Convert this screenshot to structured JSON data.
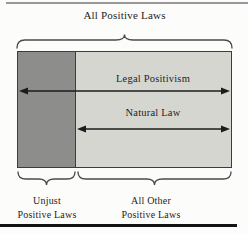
{
  "figure": {
    "title": "All Positive Laws",
    "arrows": {
      "legal_positivism": "Legal Positivism",
      "natural_law": "Natural Law"
    },
    "regions": {
      "unjust": {
        "label_line1": "Unjust",
        "label_line2": "Positive Laws"
      },
      "all_other": {
        "label_line1": "All Other",
        "label_line2": "Positive Laws"
      }
    },
    "colors": {
      "background": "#fcfcfb",
      "dark_region": "#8d8d8b",
      "light_region": "#d6d6d1",
      "rect_border": "#3d3d3d",
      "arrow": "#1c1c1c",
      "brace": "#4a4a4a",
      "text": "#1e1e1e",
      "top_rule": "#989898",
      "bottom_rule": "#141414"
    }
  }
}
